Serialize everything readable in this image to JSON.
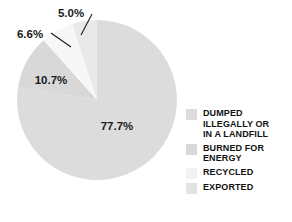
{
  "chart_data": {
    "type": "pie",
    "title": "",
    "labels": [
      "DUMPED ILLEGALLY OR IN A LANDFILL",
      "BURNED FOR ENERGY",
      "RECYCLED",
      "EXPORTED"
    ],
    "values": [
      77.7,
      10.7,
      6.6,
      5.0
    ],
    "value_labels": [
      "77.7%",
      "10.7%",
      "6.6%",
      "5.0%"
    ],
    "colors": [
      "#dcdcdc",
      "#d8d8d8",
      "#f7f7f7",
      "#e9e9e9"
    ],
    "units": "percent",
    "legend_position": "right",
    "grid": false,
    "start_angle_deg": 0,
    "direction": "clockwise"
  },
  "slices": {
    "dumped": {
      "percent_label": "77.7%",
      "color": "#dcdcdc",
      "legend_label": "DUMPED\nILLEGALLY OR\nIN A LANDFILL"
    },
    "burned": {
      "percent_label": "10.7%",
      "color": "#d8d8d8",
      "legend_label": "BURNED FOR\nENERGY"
    },
    "recycled": {
      "percent_label": "6.6%",
      "color": "#f7f7f7",
      "legend_label": "RECYCLED"
    },
    "exported": {
      "percent_label": "5.0%",
      "color": "#e9e9e9",
      "legend_label": "EXPORTED"
    }
  }
}
